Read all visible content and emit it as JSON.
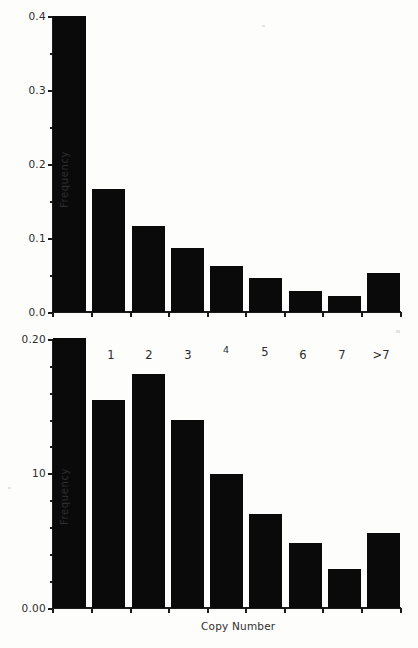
{
  "figure": {
    "background_color": "#fdfdfc",
    "bar_color": "#0a0a0a",
    "axis_color": "#1a1a1a"
  },
  "chart_data": [
    {
      "id": "top-panel",
      "type": "bar",
      "title": "",
      "xlabel": "",
      "ylabel": "Frequency",
      "categories": [
        "0",
        "1",
        "2",
        "3",
        "4",
        "5",
        "6",
        "7",
        ">7"
      ],
      "values": [
        0.4,
        0.166,
        0.116,
        0.086,
        0.062,
        0.046,
        0.028,
        0.022,
        0.053
      ],
      "ylim": [
        0.0,
        0.4
      ],
      "yticks": [
        0.0,
        0.1,
        0.2,
        0.3,
        0.4
      ],
      "ytick_labels": [
        "0.0",
        "0.1",
        "0.2",
        "0.3",
        "0.4"
      ],
      "grid": false,
      "legend": null
    },
    {
      "id": "bottom-panel",
      "type": "bar",
      "title": "",
      "xlabel": "Copy Number",
      "ylabel": "Frequency",
      "categories": [
        "0",
        "1",
        "2",
        "3",
        "4",
        "5",
        "6",
        "7",
        ">7"
      ],
      "values": [
        0.201,
        0.155,
        0.174,
        0.14,
        0.1,
        0.07,
        0.048,
        0.029,
        0.056
      ],
      "ylim": [
        0.0,
        0.2
      ],
      "yticks": [
        0.0,
        0.1,
        0.2
      ],
      "ytick_labels": [
        "0.00",
        "10",
        "0.20"
      ],
      "grid": false,
      "legend": null
    }
  ],
  "top_panel": {
    "ylabel": "Frequency",
    "ytick_labels": [
      "0.4",
      "0.3",
      "0.2",
      "0.1",
      "0.0"
    ],
    "bars": [
      {
        "category": "0",
        "value": 0.4
      },
      {
        "category": "1",
        "value": 0.166
      },
      {
        "category": "2",
        "value": 0.116
      },
      {
        "category": "3",
        "value": 0.086
      },
      {
        "category": "4",
        "value": 0.062
      },
      {
        "category": "5",
        "value": 0.046
      },
      {
        "category": "6",
        "value": 0.028
      },
      {
        "category": "7",
        "value": 0.022
      },
      {
        "category": ">7",
        "value": 0.053
      }
    ]
  },
  "bottom_panel": {
    "ylabel": "Frequency",
    "xlabel": "Copy Number",
    "ytick_labels": [
      "0.20",
      "10",
      "0.00"
    ],
    "xtick_labels": [
      "0",
      "1",
      "2",
      "3",
      "4",
      "5",
      "6",
      "7",
      ">7"
    ],
    "bars": [
      {
        "category": "0",
        "value": 0.201
      },
      {
        "category": "1",
        "value": 0.155
      },
      {
        "category": "2",
        "value": 0.174
      },
      {
        "category": "3",
        "value": 0.14
      },
      {
        "category": "4",
        "value": 0.1
      },
      {
        "category": "5",
        "value": 0.07
      },
      {
        "category": "6",
        "value": 0.048
      },
      {
        "category": "7",
        "value": 0.029
      },
      {
        "category": ">7",
        "value": 0.056
      }
    ]
  }
}
